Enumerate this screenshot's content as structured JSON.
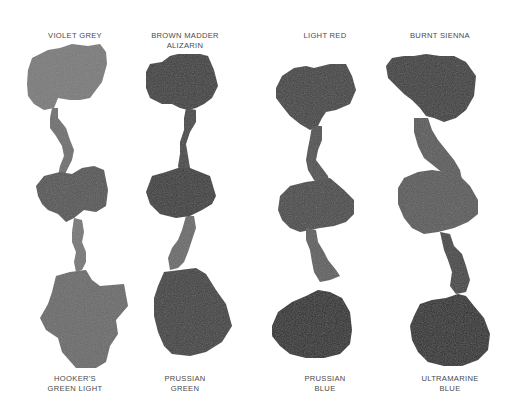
{
  "chart": {
    "title": "",
    "columns": [
      {
        "top_label": "VIOLET GREY",
        "bottom_label": "HOOKER'S\nGREEN LIGHT",
        "top_color": "#7a7a7a",
        "mid_color": "#545454",
        "bottom_color": "#6a6a6a",
        "top_label_x": 75,
        "top_label_y": 31,
        "bottom_label_x": 75,
        "bottom_label_y": 373,
        "shapes": {
          "top": "28,70 32,58 48,50 60,48 72,44 88,46 100,44 106,52 107,64 102,82 90,98 80,100 70,100 58,98 54,108 44,110 34,104 28,96 27,84",
          "stem1": "52,108 58,108 58,118 66,128 70,140 74,150 72,160 68,168 64,176 58,176 60,166 64,156 62,146 56,136 50,128 50,118",
          "mid": "36,186 44,176 60,172 72,174 82,168 94,166 104,170 108,190 106,206 96,212 84,210 74,218 66,222 58,214 48,210 42,204 38,196",
          "stem2": "74,218 82,220 84,232 82,242 86,252 86,262 82,270 76,272 74,262 76,252 72,242 72,232",
          "bottom": "52,292 56,276 70,272 86,270 92,280 100,286 124,284 128,306 116,320 118,334 110,346 106,362 96,368 76,368 62,352 58,338 46,330 40,318 48,304"
        }
      },
      {
        "top_label": "BROWN MADDER\nALIZARIN",
        "bottom_label": "PRUSSIAN\nGREEN",
        "top_color": "#3e3e3e",
        "mid_color": "#3a3a3a",
        "bottom_color": "#404040",
        "top_label_x": 185,
        "top_label_y": 31,
        "bottom_label_x": 185,
        "bottom_label_y": 373,
        "shapes": {
          "top": "146,72 150,64 162,62 170,56 178,54 190,54 200,54 208,56 214,70 218,86 212,98 204,104 196,108 188,110 180,108 172,104 162,104 150,98 146,88",
          "stem1": "186,108 196,110 196,122 190,132 186,144 188,156 190,168 186,176 180,176 178,166 180,154 180,142 184,130 184,118",
          "mid": "146,192 152,176 166,172 178,168 190,168 200,172 210,176 216,196 212,204 202,210 190,216 176,218 160,214 150,204",
          "stem2": "186,216 194,216 196,228 192,240 188,252 184,262 178,268 170,270 168,258 172,248 178,240 182,230",
          "bottom": "158,286 164,272 180,270 196,268 206,274 216,290 226,304 232,326 222,342 206,352 190,356 172,354 164,346 158,332 154,316 154,298"
        }
      },
      {
        "top_label": "LIGHT RED",
        "bottom_label": "PRUSSIAN\nBLUE",
        "top_color": "#434343",
        "mid_color": "#4a4a4a",
        "bottom_color": "#2f2f2f",
        "top_label_x": 325,
        "top_label_y": 31,
        "bottom_label_x": 325,
        "bottom_label_y": 373,
        "shapes": {
          "top": "276,88 282,76 294,68 306,66 314,68 330,64 346,64 352,76 356,90 350,104 336,110 326,112 322,118 318,126 310,130 300,124 290,116 282,106 276,98",
          "stem1": "312,126 322,126 322,140 318,150 316,160 322,168 328,176 330,186 322,188 314,180 308,170 306,160 308,148 310,138",
          "mid": "278,210 280,196 290,186 306,182 320,180 330,178 344,190 354,200 354,214 346,222 334,226 320,228 310,230 300,232 290,228 282,220",
          "stem2": "306,228 316,230 318,242 324,252 328,260 336,270 340,276 330,280 320,282 314,272 312,262 310,250 306,240",
          "bottom": "272,326 278,312 292,302 306,296 318,290 330,292 342,298 350,312 352,330 350,344 340,354 324,358 306,358 290,354 280,346 272,336"
        }
      },
      {
        "top_label": "BURNT SIENNA",
        "bottom_label": "ULTRAMARINE\nBLUE",
        "top_color": "#3c3c3c",
        "mid_color": "#5a5a5a",
        "bottom_color": "#2e2e2e",
        "top_label_x": 440,
        "top_label_y": 31,
        "bottom_label_x": 450,
        "bottom_label_y": 373,
        "shapes": {
          "top": "386,66 392,58 404,56 414,56 426,54 440,56 454,56 466,62 476,76 474,96 466,110 456,118 444,122 434,118 426,116 420,108 412,100 404,94 396,86 388,78",
          "stem1": "414,118 428,118 432,130 438,140 446,150 454,160 460,170 462,180 452,182 444,174 434,166 424,158 418,146 414,132",
          "mid": "398,188 404,178 418,172 432,170 446,172 460,176 470,186 478,200 478,214 468,222 454,228 438,232 424,234 412,228 404,218 398,204",
          "stem2": "440,232 450,234 454,246 462,254 466,266 470,280 466,292 456,294 450,286 452,272 448,260 444,250",
          "bottom": "414,316 420,304 432,300 446,298 458,294 466,296 474,306 484,318 490,334 488,350 478,360 462,366 444,366 428,362 418,352 412,340 410,326"
        }
      }
    ]
  }
}
